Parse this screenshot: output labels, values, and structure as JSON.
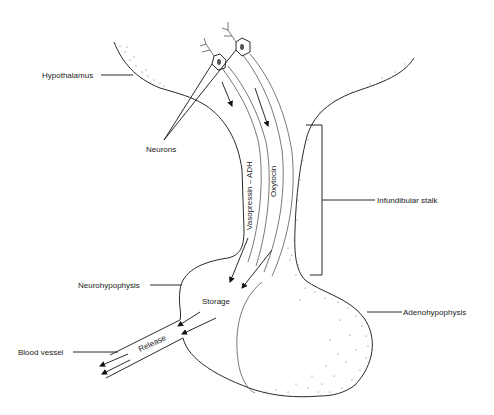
{
  "diagram": {
    "labels": {
      "hypothalamus": "Hypothalamus",
      "neurons": "Neurons",
      "vasopressin_adh": "Vasopressin  –  ADH",
      "oxytocin": "Oxytocin",
      "infundibular_stalk": "Infundibular stalk",
      "neurohypophysis": "Neurohypophysis",
      "storage": "Storage",
      "adenohypophysis": "Adenohypophysis",
      "release": "Release",
      "blood_vessel": "Blood vessel"
    },
    "colors": {
      "line": "#2a2a2a",
      "stipple": "#6a6a6a",
      "background": "#ffffff"
    }
  }
}
